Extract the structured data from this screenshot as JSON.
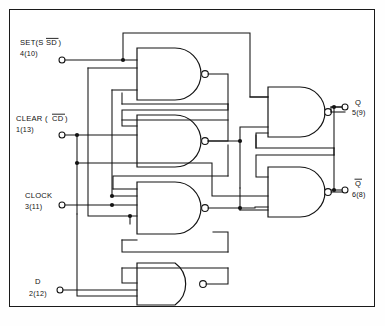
{
  "figure": {
    "kind": "logic-diagram",
    "caption": ""
  },
  "inputs": [
    {
      "id": "set",
      "name": "SET",
      "signal": "SD",
      "overline": true,
      "label": "SET(S",
      "label_tail": ")",
      "pins": "4(10)"
    },
    {
      "id": "clear",
      "name": "CLEAR",
      "signal": "CD",
      "overline": true,
      "label": "CLEAR (",
      "label_tail": ")",
      "pins": "1(13)"
    },
    {
      "id": "clock",
      "name": "CLOCK",
      "signal": "",
      "overline": false,
      "label": "CLOCK",
      "label_tail": "",
      "pins": "3(11)"
    },
    {
      "id": "d",
      "name": "D",
      "signal": "",
      "overline": false,
      "label": "D",
      "label_tail": "",
      "pins": "2(12)"
    }
  ],
  "outputs": [
    {
      "id": "q",
      "label": "Q",
      "overline": false,
      "pins": "5(9)"
    },
    {
      "id": "qbar",
      "label": "Q",
      "overline": true,
      "pins": "6(8)"
    }
  ],
  "overlines": {
    "sd": "SD",
    "cd": "CD",
    "qbar": "Q"
  },
  "gates": [
    {
      "id": "g1",
      "type": "NAND",
      "inputs": 3
    },
    {
      "id": "g2",
      "type": "NAND",
      "inputs": 3
    },
    {
      "id": "g3",
      "type": "NAND",
      "inputs": 3
    },
    {
      "id": "g4",
      "type": "NAND",
      "inputs": 3
    },
    {
      "id": "g5",
      "type": "NAND",
      "inputs": 2
    },
    {
      "id": "g6",
      "type": "NAND",
      "inputs": 2
    }
  ],
  "colors": {
    "line": "#141414",
    "fill": "#ffffff",
    "frame": "#1a1a1a"
  }
}
